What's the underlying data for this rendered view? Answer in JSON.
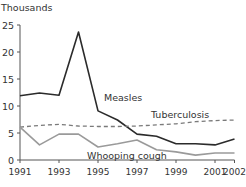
{
  "chart_data": {
    "type": "line",
    "title": "",
    "ylabel": "Thousands",
    "xlabel": "",
    "ylim": [
      0,
      25
    ],
    "yticks": [
      0,
      5,
      10,
      15,
      20,
      25
    ],
    "xlim": [
      1991,
      2002
    ],
    "xticks": [
      1991,
      1993,
      1995,
      1997,
      1999,
      2001,
      2002
    ],
    "x": [
      1991,
      1992,
      1993,
      1994,
      1995,
      1996,
      1997,
      1998,
      1999,
      2000,
      2001,
      2002
    ],
    "grid": false,
    "legend": "inline labels",
    "series": [
      {
        "name": "Measles",
        "style": "solid",
        "color": "#2b2b2b",
        "values": [
          11.9,
          12.4,
          12.0,
          23.7,
          9.1,
          7.4,
          4.8,
          4.4,
          3.0,
          3.0,
          2.8,
          3.9
        ],
        "label_pos": [
          104,
          101
        ]
      },
      {
        "name": "Tuberculosis",
        "style": "dashed",
        "color": "#7a7a7a",
        "values": [
          6.1,
          6.4,
          6.6,
          6.3,
          6.2,
          6.2,
          6.3,
          6.5,
          6.7,
          7.1,
          7.3,
          7.4
        ],
        "label_pos": [
          151,
          118
        ]
      },
      {
        "name": "Whooping cough",
        "style": "solid",
        "color": "#9a9a9a",
        "values": [
          6.1,
          2.8,
          4.8,
          4.8,
          2.4,
          3.0,
          3.7,
          1.9,
          1.5,
          0.9,
          1.3,
          1.3
        ],
        "label_pos": [
          87,
          159
        ]
      }
    ]
  }
}
